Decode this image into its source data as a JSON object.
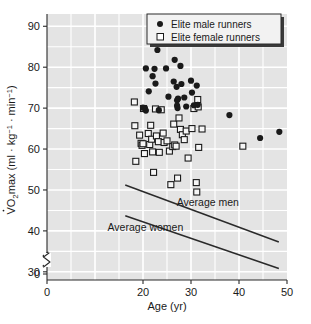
{
  "chart_data": {
    "type": "scatter",
    "title": "",
    "xlabel": "Age (yr)",
    "ylabel": "VO2max (ml · kg-1 · min-1)",
    "ylabel_parts": {
      "v_dot": "V",
      "o": "O",
      "two": "2",
      "max": "max (ml · kg",
      "exp1": "−1",
      "middot": " · min",
      "exp2": "−1",
      "close": ")"
    },
    "xlim": [
      0,
      50
    ],
    "ylim": [
      28,
      93
    ],
    "y_break": true,
    "xticks": [
      0,
      20,
      30,
      40,
      50
    ],
    "yticks": [
      0,
      30,
      40,
      50,
      60,
      70,
      80,
      90
    ],
    "xtick_labels": [
      "0",
      "20",
      "30",
      "40",
      "50"
    ],
    "ytick_labels": [
      "0",
      "30",
      "40",
      "50",
      "60",
      "70",
      "80",
      "90"
    ],
    "grid": "white gridlines on light gray panel, every 5 units both axes",
    "plot_bg": "#e4e4e4",
    "grid_color": "#ffffff",
    "legend": {
      "position": "top-right",
      "entries": [
        {
          "label": "Elite male runners",
          "marker": "filled-circle",
          "color": "#1a1a1a"
        },
        {
          "label": "Elite female runners",
          "marker": "open-square",
          "color": "#1a1a1a"
        }
      ]
    },
    "annotations": [
      {
        "text": "Average men",
        "x": 33.5,
        "y": 46.0
      },
      {
        "text": "Average women",
        "x": 20.5,
        "y": 40.0
      }
    ],
    "series": [
      {
        "name": "Elite male runners",
        "marker": "filled-circle",
        "color": "#1a1a1a",
        "points": [
          [
            20.6,
            79.7
          ],
          [
            20.4,
            70.0
          ],
          [
            20.6,
            69.4
          ],
          [
            21.2,
            74.1
          ],
          [
            22.0,
            77.8
          ],
          [
            22.4,
            79.6
          ],
          [
            22.6,
            76.0
          ],
          [
            23.0,
            84.2
          ],
          [
            24.8,
            79.7
          ],
          [
            25.3,
            72.8
          ],
          [
            26.4,
            76.5
          ],
          [
            26.6,
            81.8
          ],
          [
            27.0,
            75.2
          ],
          [
            27.1,
            71.9
          ],
          [
            27.1,
            70.6
          ],
          [
            27.2,
            70.0
          ],
          [
            27.3,
            72.3
          ],
          [
            27.8,
            80.3
          ],
          [
            28.0,
            75.9
          ],
          [
            28.6,
            72.6
          ],
          [
            29.0,
            70.4
          ],
          [
            30.0,
            76.7
          ],
          [
            30.2,
            73.8
          ],
          [
            30.6,
            70.7
          ],
          [
            31.2,
            75.5
          ],
          [
            31.4,
            70.8
          ],
          [
            20.0,
            70.1
          ],
          [
            23.3,
            69.5
          ],
          [
            38.0,
            68.3
          ],
          [
            44.4,
            62.7
          ],
          [
            48.4,
            64.2
          ]
        ]
      },
      {
        "name": "Elite female runners",
        "marker": "open-square",
        "color": "#1a1a1a",
        "points": [
          [
            18.2,
            71.5
          ],
          [
            18.3,
            65.7
          ],
          [
            18.5,
            57.0
          ],
          [
            19.3,
            63.4
          ],
          [
            19.6,
            61.4
          ],
          [
            19.8,
            60.9
          ],
          [
            20.0,
            61.3
          ],
          [
            20.1,
            69.9
          ],
          [
            20.3,
            58.9
          ],
          [
            21.1,
            63.8
          ],
          [
            21.4,
            61.1
          ],
          [
            21.6,
            65.8
          ],
          [
            21.8,
            62.4
          ],
          [
            22.0,
            59.3
          ],
          [
            22.2,
            54.3
          ],
          [
            22.6,
            69.8
          ],
          [
            22.8,
            63.2
          ],
          [
            23.2,
            61.8
          ],
          [
            23.4,
            59.2
          ],
          [
            23.8,
            69.6
          ],
          [
            24.2,
            63.9
          ],
          [
            24.4,
            61.6
          ],
          [
            25.0,
            62.0
          ],
          [
            25.5,
            59.5
          ],
          [
            25.8,
            51.3
          ],
          [
            26.2,
            60.6
          ],
          [
            26.4,
            66.1
          ],
          [
            26.6,
            61.0
          ],
          [
            26.9,
            60.7
          ],
          [
            27.2,
            52.9
          ],
          [
            27.5,
            67.6
          ],
          [
            27.8,
            64.8
          ],
          [
            28.2,
            63.5
          ],
          [
            28.6,
            62.3
          ],
          [
            29.0,
            64.4
          ],
          [
            29.4,
            57.8
          ],
          [
            30.2,
            65.0
          ],
          [
            30.6,
            69.9
          ],
          [
            31.1,
            51.8
          ],
          [
            31.2,
            49.5
          ],
          [
            31.4,
            72.1
          ],
          [
            31.5,
            70.3
          ],
          [
            31.6,
            60.4
          ],
          [
            32.3,
            64.9
          ],
          [
            40.8,
            60.7
          ]
        ]
      }
    ],
    "trend_lines": [
      {
        "name": "Average men",
        "x_start": 16.3,
        "y_start": 51.2,
        "x_end": 48.3,
        "y_end": 37.3
      },
      {
        "name": "Average women",
        "x_start": 16.3,
        "y_start": 43.7,
        "x_end": 48.3,
        "y_end": 30.8
      }
    ]
  }
}
